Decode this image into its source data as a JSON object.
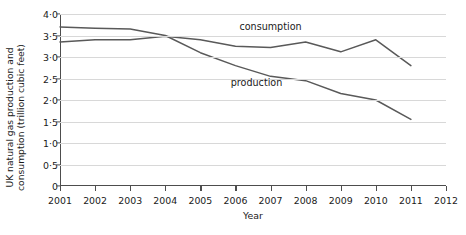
{
  "chart_data": {
    "type": "line",
    "title": "",
    "xlabel": "Year",
    "ylabel": "UK natural gas production and\nconsumption (trillion cubic feet)",
    "x": [
      2001,
      2002,
      2003,
      2004,
      2005,
      2006,
      2007,
      2008,
      2009,
      2010,
      2011
    ],
    "xlim": [
      2001,
      2012
    ],
    "ylim": [
      0,
      4.0
    ],
    "grid": true,
    "legend_position": "inline-labels",
    "xtick_labels": [
      "2001",
      "2002",
      "2003",
      "2004",
      "2005",
      "2006",
      "2007",
      "2008",
      "2009",
      "2010",
      "2011",
      "2012"
    ],
    "ytick_labels": [
      "0",
      "0·5",
      "1·0",
      "1·5",
      "2·0",
      "2·5",
      "3·0",
      "3·5",
      "4·0"
    ],
    "ytick_values": [
      0,
      0.5,
      1.0,
      1.5,
      2.0,
      2.5,
      3.0,
      3.5,
      4.0
    ],
    "series": [
      {
        "name": "production",
        "label": "production",
        "color": "#595959",
        "values": [
          3.7,
          3.67,
          3.65,
          3.5,
          3.1,
          2.8,
          2.55,
          2.45,
          2.15,
          2.0,
          1.55
        ]
      },
      {
        "name": "consumption",
        "label": "consumption",
        "color": "#595959",
        "values": [
          3.35,
          3.4,
          3.4,
          3.48,
          3.4,
          3.25,
          3.22,
          3.35,
          3.12,
          3.4,
          2.8
        ]
      }
    ],
    "annotations": [
      {
        "text": "consumption",
        "x": 2007.0,
        "y": 3.72
      },
      {
        "text": "production",
        "x": 2006.6,
        "y": 2.42
      }
    ]
  },
  "colors": {
    "axis": "#4d4d4d",
    "grid": "#d8d8d8",
    "line": "#595959",
    "text": "#1a1a1a",
    "background": "#ffffff"
  }
}
